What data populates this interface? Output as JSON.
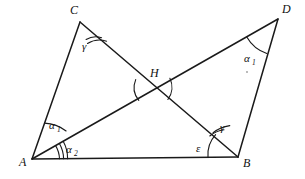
{
  "figure": {
    "stroke_color": "#1a1a1a",
    "background_color": "#ffffff",
    "width": 305,
    "height": 179
  },
  "vertices": {
    "A": {
      "label": "A",
      "x": 32,
      "y": 159,
      "label_x": 19,
      "label_y": 166
    },
    "B": {
      "label": "B",
      "x": 238,
      "y": 157,
      "label_x": 243,
      "label_y": 167
    },
    "C": {
      "label": "C",
      "x": 80,
      "y": 22,
      "label_x": 70,
      "label_y": 14
    },
    "D": {
      "label": "D",
      "x": 278,
      "y": 19,
      "label_x": 282,
      "label_y": 13
    },
    "H": {
      "label": "H",
      "x": 154,
      "y": 89,
      "label_x": 150,
      "label_y": 77
    }
  },
  "segments": [
    {
      "name": "segment-AC",
      "from": "A",
      "to": "C"
    },
    {
      "name": "segment-AB",
      "from": "A",
      "to": "B"
    },
    {
      "name": "segment-AD",
      "from": "A",
      "to": "D"
    },
    {
      "name": "segment-CB",
      "from": "C",
      "to": "B"
    },
    {
      "name": "segment-BD",
      "from": "B",
      "to": "D"
    }
  ],
  "angles": [
    {
      "name": "angle-C-gamma",
      "symbol": "γ",
      "subscript": "",
      "vertex": "C",
      "arcs": 2,
      "label_x": 82,
      "label_y": 50
    },
    {
      "name": "angle-A-alpha1",
      "symbol": "α",
      "subscript": "1",
      "vertex": "A",
      "arcs": 1,
      "label_x": 49,
      "label_y": 129
    },
    {
      "name": "angle-A-alpha2",
      "symbol": "α",
      "subscript": "2",
      "vertex": "A",
      "arcs": 3,
      "label_x": 66,
      "label_y": 153
    },
    {
      "name": "angle-B-epsilon",
      "symbol": "ε",
      "subscript": "",
      "vertex": "B",
      "arcs": 1,
      "label_x": 196,
      "label_y": 152
    },
    {
      "name": "angle-B-gamma",
      "symbol": "γ",
      "subscript": "",
      "vertex": "B",
      "arcs": 2,
      "label_x": 220,
      "label_y": 131
    },
    {
      "name": "angle-D-alpha1",
      "symbol": "α",
      "subscript": "1",
      "vertex": "D",
      "arcs": 1,
      "label_x": 244,
      "label_y": 62
    }
  ],
  "intersection": {
    "name": "intersection-H",
    "label": "H",
    "arcs_left": 1,
    "arcs_right": 1
  }
}
